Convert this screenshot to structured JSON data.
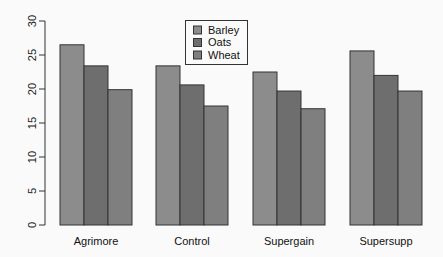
{
  "chart_data": {
    "type": "bar",
    "title": "",
    "xlabel": "",
    "ylabel": "",
    "ylim": [
      0,
      30
    ],
    "yticks": [
      0,
      5,
      10,
      15,
      20,
      25,
      30
    ],
    "grid": false,
    "legend_position": "top-center",
    "categories": [
      "Agrimore",
      "Control",
      "Supergain",
      "Supersupp"
    ],
    "series": [
      {
        "name": "Barley",
        "color": "#8c8c8c",
        "values": [
          26.5,
          23.4,
          22.5,
          25.6
        ]
      },
      {
        "name": "Oats",
        "color": "#6e6e6e",
        "values": [
          23.4,
          20.6,
          19.7,
          22.0
        ]
      },
      {
        "name": "Wheat",
        "color": "#7f7f7f",
        "values": [
          19.9,
          17.5,
          17.1,
          19.7
        ]
      }
    ]
  }
}
